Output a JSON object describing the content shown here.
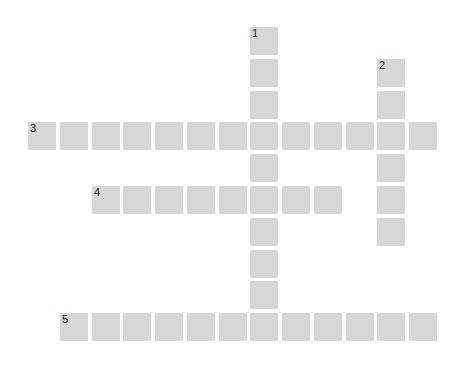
{
  "puzzle": {
    "type": "crossword",
    "colors": {
      "background": "#ffffff",
      "cell": "#d7d7d7",
      "number": "#1c1c1c"
    },
    "grid_size": {
      "rows": 10,
      "cols": 13
    },
    "words": [
      {
        "number": "1",
        "direction": "down",
        "row": 0,
        "col": 7,
        "length": 10
      },
      {
        "number": "2",
        "direction": "down",
        "row": 1,
        "col": 11,
        "length": 6
      },
      {
        "number": "3",
        "direction": "across",
        "row": 3,
        "col": 0,
        "length": 13
      },
      {
        "number": "4",
        "direction": "across",
        "row": 5,
        "col": 2,
        "length": 8
      },
      {
        "number": "5",
        "direction": "across",
        "row": 9,
        "col": 1,
        "length": 12
      }
    ]
  }
}
